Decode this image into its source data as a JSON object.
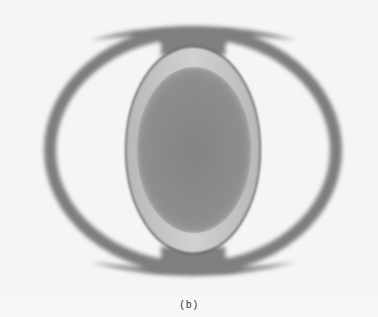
{
  "figure": {
    "panel_label": "(b)",
    "colors": {
      "background": "#f7f7f5",
      "ring": "#7a7a7a",
      "lens_edge": "#6e6e6e",
      "lens_band": "#c4c4c4",
      "core": "#8a8a8a"
    }
  }
}
